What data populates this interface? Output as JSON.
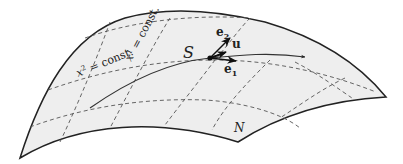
{
  "diagram": {
    "surface_label": "N",
    "point_label": "S",
    "vectors": {
      "e1": {
        "base": "e",
        "sub": "1"
      },
      "e2": {
        "base": "e",
        "sub": "2"
      },
      "u": {
        "label": "u"
      }
    },
    "coordinate_lines": {
      "x2": {
        "var": "x",
        "sup": "2",
        "eq": " = const."
      },
      "x1": {
        "var": "x",
        "sup": "1",
        "eq": " = const."
      }
    },
    "colors": {
      "surface_fill": "#eeeeee",
      "outline": "#222222",
      "dashed": "#555555",
      "curve": "#333333"
    }
  }
}
